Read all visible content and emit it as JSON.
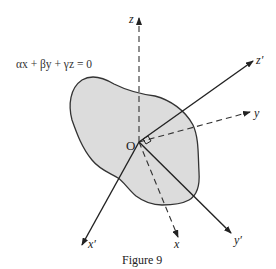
{
  "figure": {
    "caption": "Figure 9",
    "plane_equation": "αx + βy + γz = 0",
    "origin_label": "O",
    "axes": {
      "z": {
        "label": "z",
        "style": "dashed"
      },
      "y": {
        "label": "y",
        "style": "dashed"
      },
      "x": {
        "label": "x",
        "style": "dashed"
      },
      "z_prime": {
        "label": "z′",
        "style": "solid"
      },
      "y_prime": {
        "label": "y′",
        "style": "solid"
      },
      "x_prime": {
        "label": "x′",
        "style": "solid"
      }
    },
    "colors": {
      "plane_fill": "#dcdcdc",
      "stroke": "#222222"
    }
  }
}
